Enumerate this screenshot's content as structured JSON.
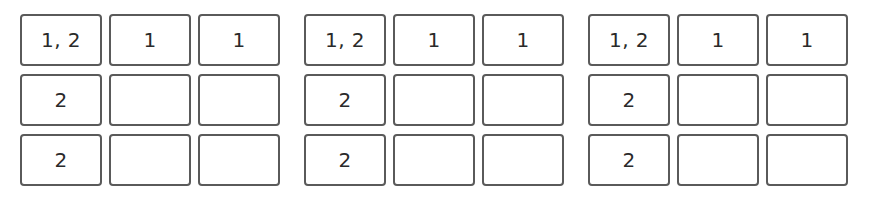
{
  "grids": [
    {
      "cells": [
        [
          "1, 2",
          "1",
          "1"
        ],
        [
          "2",
          "",
          ""
        ],
        [
          "2",
          "",
          ""
        ]
      ]
    },
    {
      "cells": [
        [
          "1, 2",
          "1",
          "1"
        ],
        [
          "2",
          "",
          ""
        ],
        [
          "2",
          "",
          ""
        ]
      ]
    },
    {
      "cells": [
        [
          "1, 2",
          "1",
          "1"
        ],
        [
          "2",
          "",
          ""
        ],
        [
          "2",
          "",
          ""
        ]
      ]
    }
  ],
  "colors": {
    "border": "#5a5a5a",
    "text": "#2a2a2a",
    "background": "#ffffff"
  }
}
